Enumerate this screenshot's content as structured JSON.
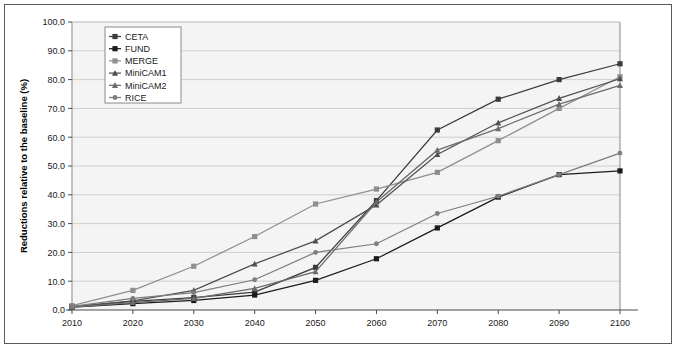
{
  "chart_data": {
    "type": "line",
    "title": "",
    "xlabel": "",
    "ylabel": "Reductions relative to the baseline (%)",
    "x": [
      2010,
      2020,
      2030,
      2040,
      2050,
      2060,
      2070,
      2080,
      2090,
      2100
    ],
    "xticklabels": [
      "2010",
      "2020",
      "2030",
      "2040",
      "2050",
      "2060",
      "2070",
      "2080",
      "2090",
      "2100"
    ],
    "yticklabels": [
      "0.0",
      "10.0",
      "20.0",
      "30.0",
      "40.0",
      "50.0",
      "60.0",
      "70.0",
      "80.0",
      "90.0",
      "100.0"
    ],
    "ytickvalues": [
      0,
      10,
      20,
      30,
      40,
      50,
      60,
      70,
      80,
      90,
      100
    ],
    "xlim": [
      2010,
      2100
    ],
    "ylim": [
      0,
      100
    ],
    "grid": "horizontal",
    "legend_position": "top-left-inside",
    "series": [
      {
        "name": "CETA",
        "marker": "square",
        "color": "#3b3b3b",
        "values": [
          1.2,
          3.0,
          4.3,
          6.2,
          14.8,
          38.0,
          62.5,
          73.2,
          80.0,
          85.5
        ]
      },
      {
        "name": "FUND",
        "marker": "square",
        "color": "#1b1b1b",
        "values": [
          1.0,
          2.2,
          3.3,
          5.2,
          10.3,
          17.8,
          28.5,
          39.2,
          47.0,
          48.3
        ]
      },
      {
        "name": "MERGE",
        "marker": "square",
        "color": "#8e8e8e",
        "values": [
          1.5,
          6.8,
          15.2,
          25.5,
          36.8,
          42.0,
          47.8,
          58.8,
          70.0,
          81.0
        ]
      },
      {
        "name": "MiniCAM1",
        "marker": "triangle",
        "color": "#4f4f4f",
        "values": [
          1.1,
          3.2,
          6.8,
          16.0,
          24.0,
          36.5,
          54.0,
          65.0,
          73.5,
          80.3
        ]
      },
      {
        "name": "MiniCAM2",
        "marker": "triangle",
        "color": "#6b6b6b",
        "values": [
          1.0,
          2.6,
          4.0,
          7.5,
          13.3,
          37.5,
          55.5,
          63.0,
          71.5,
          78.0
        ]
      },
      {
        "name": "RICE",
        "marker": "circle",
        "color": "#7d7d7d",
        "values": [
          1.3,
          4.0,
          6.0,
          10.5,
          20.0,
          23.0,
          33.5,
          39.5,
          47.0,
          54.5
        ]
      }
    ]
  },
  "legend": {
    "items": [
      "CETA",
      "FUND",
      "MERGE",
      "MiniCAM1",
      "MiniCAM2",
      "RICE"
    ]
  }
}
